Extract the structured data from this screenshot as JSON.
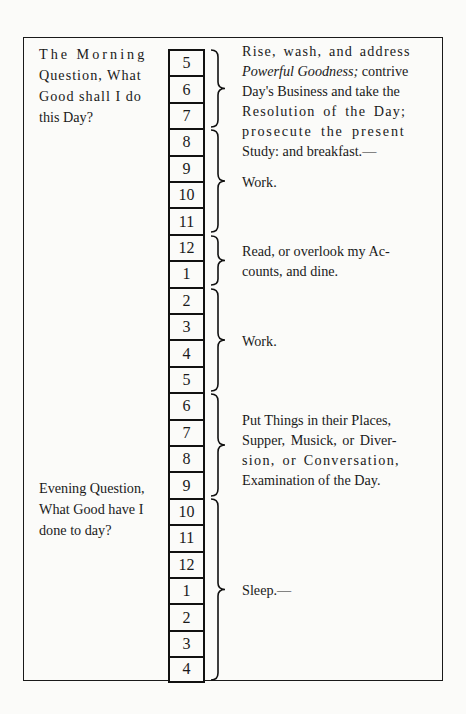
{
  "schedule": {
    "morning_question": {
      "line1": "The Morning",
      "line2": "Question, What",
      "line3": "Good shall I do",
      "line4": "this Day?"
    },
    "evening_question": {
      "line1": "Evening Question,",
      "line2": "What Good have I",
      "line3": "done to day?"
    },
    "hours": [
      "5",
      "6",
      "7",
      "8",
      "9",
      "10",
      "11",
      "12",
      "1",
      "2",
      "3",
      "4",
      "5",
      "6",
      "7",
      "8",
      "9",
      "10",
      "11",
      "12",
      "1",
      "2",
      "3",
      "4"
    ],
    "blocks": [
      {
        "hours": "5-7",
        "lines": [
          "Rise, wash, and address",
          "Powerful Goodness;",
          " contrive",
          "Day's Business and take the",
          "Resolution of the Day;",
          "prosecute the present",
          "Study: and breakfast.—"
        ]
      },
      {
        "hours": "8-11",
        "text": "Work."
      },
      {
        "hours": "12-1",
        "lines": [
          "Read, or overlook my Ac-",
          "counts, and dine."
        ]
      },
      {
        "hours": "2-5",
        "text": "Work."
      },
      {
        "hours": "6-9",
        "lines": [
          "Put Things in their Places,",
          "Supper, Musick, or Diver-",
          "sion, or Conversation,",
          "Examination of the Day."
        ]
      },
      {
        "hours": "10-4",
        "text": "Sleep.—"
      }
    ]
  }
}
